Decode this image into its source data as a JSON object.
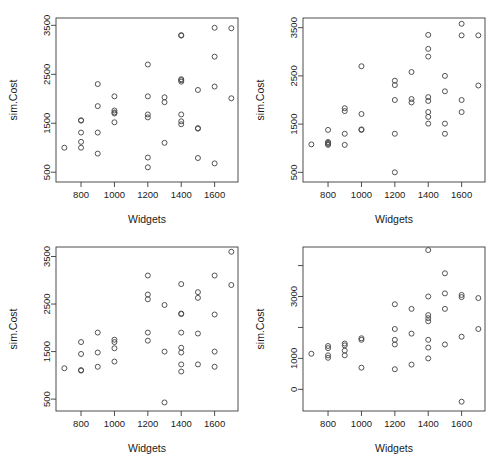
{
  "figure": {
    "title": "",
    "background": "#ffffff",
    "point_color": "#4a4a4a",
    "axis_color": "#3a3a3a",
    "layout": "2x2 grid of scatterplots"
  },
  "chart_data": [
    {
      "id": "panel-top-left",
      "type": "scatter",
      "title": "",
      "xlabel": "Widgets",
      "ylabel": "sim.Cost",
      "xlim": [
        650,
        1740
      ],
      "ylim": [
        300,
        3650
      ],
      "xticks": [
        800,
        1000,
        1200,
        1400,
        1600
      ],
      "yticks": [
        500,
        1500,
        2500,
        3500
      ],
      "grid": false,
      "legend": null,
      "marker": "open-circle",
      "points": [
        {
          "x": 700,
          "y": 1000
        },
        {
          "x": 800,
          "y": 1560
        },
        {
          "x": 800,
          "y": 1555
        },
        {
          "x": 800,
          "y": 1310
        },
        {
          "x": 800,
          "y": 1120
        },
        {
          "x": 800,
          "y": 1000
        },
        {
          "x": 900,
          "y": 2300
        },
        {
          "x": 900,
          "y": 1850
        },
        {
          "x": 900,
          "y": 1310
        },
        {
          "x": 900,
          "y": 880
        },
        {
          "x": 1000,
          "y": 2050
        },
        {
          "x": 1000,
          "y": 1760
        },
        {
          "x": 1000,
          "y": 1720
        },
        {
          "x": 1000,
          "y": 1700
        },
        {
          "x": 1000,
          "y": 1520
        },
        {
          "x": 1200,
          "y": 2700
        },
        {
          "x": 1200,
          "y": 2050
        },
        {
          "x": 1200,
          "y": 1680
        },
        {
          "x": 1200,
          "y": 1620
        },
        {
          "x": 1200,
          "y": 800
        },
        {
          "x": 1200,
          "y": 600
        },
        {
          "x": 1300,
          "y": 2030
        },
        {
          "x": 1300,
          "y": 1930
        },
        {
          "x": 1300,
          "y": 1100
        },
        {
          "x": 1400,
          "y": 3300
        },
        {
          "x": 1400,
          "y": 3290
        },
        {
          "x": 1400,
          "y": 2400
        },
        {
          "x": 1400,
          "y": 2380
        },
        {
          "x": 1400,
          "y": 2350
        },
        {
          "x": 1400,
          "y": 1680
        },
        {
          "x": 1400,
          "y": 1540
        },
        {
          "x": 1400,
          "y": 1480
        },
        {
          "x": 1500,
          "y": 2180
        },
        {
          "x": 1500,
          "y": 1400
        },
        {
          "x": 1500,
          "y": 1390
        },
        {
          "x": 1500,
          "y": 790
        },
        {
          "x": 1600,
          "y": 3450
        },
        {
          "x": 1600,
          "y": 2860
        },
        {
          "x": 1600,
          "y": 2250
        },
        {
          "x": 1600,
          "y": 680
        },
        {
          "x": 1700,
          "y": 3440
        },
        {
          "x": 1700,
          "y": 2010
        }
      ]
    },
    {
      "id": "panel-top-right",
      "type": "scatter",
      "title": "",
      "xlabel": "Widgets",
      "ylabel": "sim.Cost",
      "xlim": [
        650,
        1740
      ],
      "ylim": [
        300,
        3700
      ],
      "xticks": [
        800,
        1000,
        1200,
        1400,
        1600
      ],
      "yticks": [
        500,
        1500,
        2500,
        3500
      ],
      "grid": false,
      "legend": null,
      "marker": "open-circle",
      "points": [
        {
          "x": 700,
          "y": 1080
        },
        {
          "x": 800,
          "y": 1380
        },
        {
          "x": 800,
          "y": 1130
        },
        {
          "x": 800,
          "y": 1110
        },
        {
          "x": 800,
          "y": 1090
        },
        {
          "x": 800,
          "y": 1070
        },
        {
          "x": 900,
          "y": 1830
        },
        {
          "x": 900,
          "y": 1770
        },
        {
          "x": 900,
          "y": 1300
        },
        {
          "x": 900,
          "y": 1070
        },
        {
          "x": 1000,
          "y": 2700
        },
        {
          "x": 1000,
          "y": 1710
        },
        {
          "x": 1000,
          "y": 1390
        },
        {
          "x": 1000,
          "y": 1380
        },
        {
          "x": 1200,
          "y": 2400
        },
        {
          "x": 1200,
          "y": 2310
        },
        {
          "x": 1200,
          "y": 2000
        },
        {
          "x": 1200,
          "y": 1300
        },
        {
          "x": 1200,
          "y": 500
        },
        {
          "x": 1300,
          "y": 2580
        },
        {
          "x": 1300,
          "y": 2020
        },
        {
          "x": 1300,
          "y": 1950
        },
        {
          "x": 1400,
          "y": 3350
        },
        {
          "x": 1400,
          "y": 3060
        },
        {
          "x": 1400,
          "y": 2900
        },
        {
          "x": 1400,
          "y": 2060
        },
        {
          "x": 1400,
          "y": 1980
        },
        {
          "x": 1400,
          "y": 1750
        },
        {
          "x": 1400,
          "y": 1650
        },
        {
          "x": 1400,
          "y": 1510
        },
        {
          "x": 1500,
          "y": 2500
        },
        {
          "x": 1500,
          "y": 2180
        },
        {
          "x": 1500,
          "y": 1510
        },
        {
          "x": 1500,
          "y": 1300
        },
        {
          "x": 1600,
          "y": 3580
        },
        {
          "x": 1600,
          "y": 3340
        },
        {
          "x": 1600,
          "y": 2000
        },
        {
          "x": 1600,
          "y": 1750
        },
        {
          "x": 1700,
          "y": 3340
        },
        {
          "x": 1700,
          "y": 2300
        }
      ]
    },
    {
      "id": "panel-bottom-left",
      "type": "scatter",
      "title": "",
      "xlabel": "Widgets",
      "ylabel": "sim.Cost",
      "xlim": [
        650,
        1740
      ],
      "ylim": [
        250,
        3700
      ],
      "xticks": [
        800,
        1000,
        1200,
        1400,
        1600
      ],
      "yticks": [
        500,
        1500,
        2500,
        3500
      ],
      "grid": false,
      "legend": null,
      "marker": "open-circle",
      "points": [
        {
          "x": 700,
          "y": 1150
        },
        {
          "x": 800,
          "y": 1700
        },
        {
          "x": 800,
          "y": 1450
        },
        {
          "x": 800,
          "y": 1110
        },
        {
          "x": 800,
          "y": 1100
        },
        {
          "x": 900,
          "y": 1900
        },
        {
          "x": 900,
          "y": 1480
        },
        {
          "x": 900,
          "y": 1180
        },
        {
          "x": 1000,
          "y": 1750
        },
        {
          "x": 1000,
          "y": 1700
        },
        {
          "x": 1000,
          "y": 1570
        },
        {
          "x": 1000,
          "y": 1290
        },
        {
          "x": 1200,
          "y": 3100
        },
        {
          "x": 1200,
          "y": 2700
        },
        {
          "x": 1200,
          "y": 2600
        },
        {
          "x": 1200,
          "y": 1900
        },
        {
          "x": 1200,
          "y": 1730
        },
        {
          "x": 1300,
          "y": 2480
        },
        {
          "x": 1300,
          "y": 1500
        },
        {
          "x": 1300,
          "y": 430
        },
        {
          "x": 1400,
          "y": 2920
        },
        {
          "x": 1400,
          "y": 2300
        },
        {
          "x": 1400,
          "y": 2290
        },
        {
          "x": 1400,
          "y": 1900
        },
        {
          "x": 1400,
          "y": 1580
        },
        {
          "x": 1400,
          "y": 1480
        },
        {
          "x": 1400,
          "y": 1230
        },
        {
          "x": 1400,
          "y": 1080
        },
        {
          "x": 1500,
          "y": 2750
        },
        {
          "x": 1500,
          "y": 2630
        },
        {
          "x": 1500,
          "y": 1880
        },
        {
          "x": 1500,
          "y": 1230
        },
        {
          "x": 1600,
          "y": 3100
        },
        {
          "x": 1600,
          "y": 2280
        },
        {
          "x": 1600,
          "y": 1500
        },
        {
          "x": 1600,
          "y": 1180
        },
        {
          "x": 1700,
          "y": 3600
        },
        {
          "x": 1700,
          "y": 2900
        }
      ]
    },
    {
      "id": "panel-bottom-right",
      "type": "scatter",
      "title": "",
      "xlabel": "Widgets",
      "ylabel": "sim.Cost",
      "xlim": [
        650,
        1740
      ],
      "ylim": [
        -700,
        4600
      ],
      "xticks": [
        800,
        1000,
        1200,
        1400,
        1600
      ],
      "yticks": [
        0,
        1000,
        3000
      ],
      "yticks_minor": [
        2000,
        4000
      ],
      "grid": false,
      "legend": null,
      "marker": "open-circle",
      "points": [
        {
          "x": 700,
          "y": 1150
        },
        {
          "x": 800,
          "y": 1400
        },
        {
          "x": 800,
          "y": 1330
        },
        {
          "x": 800,
          "y": 1100
        },
        {
          "x": 800,
          "y": 1020
        },
        {
          "x": 900,
          "y": 1480
        },
        {
          "x": 900,
          "y": 1420
        },
        {
          "x": 900,
          "y": 1250
        },
        {
          "x": 900,
          "y": 1100
        },
        {
          "x": 1000,
          "y": 1650
        },
        {
          "x": 1000,
          "y": 1600
        },
        {
          "x": 1000,
          "y": 700
        },
        {
          "x": 1200,
          "y": 2750
        },
        {
          "x": 1200,
          "y": 1950
        },
        {
          "x": 1200,
          "y": 1600
        },
        {
          "x": 1200,
          "y": 1450
        },
        {
          "x": 1200,
          "y": 650
        },
        {
          "x": 1300,
          "y": 2600
        },
        {
          "x": 1300,
          "y": 1800
        },
        {
          "x": 1300,
          "y": 800
        },
        {
          "x": 1400,
          "y": 4500
        },
        {
          "x": 1400,
          "y": 3000
        },
        {
          "x": 1400,
          "y": 2400
        },
        {
          "x": 1400,
          "y": 2300
        },
        {
          "x": 1400,
          "y": 2200
        },
        {
          "x": 1400,
          "y": 1600
        },
        {
          "x": 1400,
          "y": 1350
        },
        {
          "x": 1400,
          "y": 1000
        },
        {
          "x": 1500,
          "y": 3750
        },
        {
          "x": 1500,
          "y": 3100
        },
        {
          "x": 1500,
          "y": 2600
        },
        {
          "x": 1500,
          "y": 1450
        },
        {
          "x": 1600,
          "y": 3050
        },
        {
          "x": 1600,
          "y": 2980
        },
        {
          "x": 1600,
          "y": 1700
        },
        {
          "x": 1600,
          "y": -400
        },
        {
          "x": 1700,
          "y": 2950
        },
        {
          "x": 1700,
          "y": 1950
        }
      ]
    }
  ]
}
